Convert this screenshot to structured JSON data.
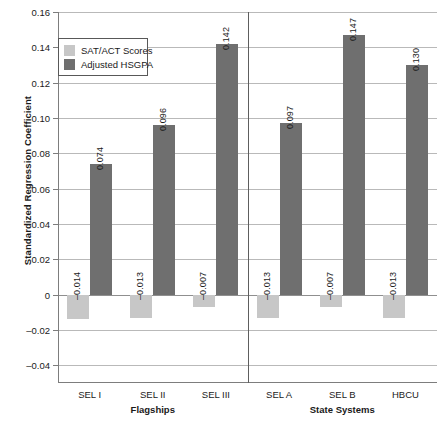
{
  "chart_data": {
    "type": "bar",
    "title": "",
    "xlabel": "",
    "ylabel": "Standardized Regression Coefficient",
    "ylim": [
      -0.05,
      0.16
    ],
    "yticks": [
      0.16,
      0.14,
      0.12,
      0.1,
      0.08,
      0.06,
      0.04,
      0.02,
      0,
      -0.02,
      -0.04
    ],
    "ytick_labels": [
      "0.16",
      "0.14",
      "0.12",
      "0.10",
      "0.08",
      "0.06",
      "0.04",
      "0.02",
      "0",
      "–0.02",
      "–0.04"
    ],
    "grid": true,
    "legend_position": "upper-left",
    "categories": [
      "SEL I",
      "SEL II",
      "SEL III",
      "SEL A",
      "SEL B",
      "HBCU"
    ],
    "groups": [
      {
        "label": "Flagships",
        "categories": [
          "SEL I",
          "SEL II",
          "SEL III"
        ]
      },
      {
        "label": "State Systems",
        "categories": [
          "SEL A",
          "SEL B",
          "HBCU"
        ]
      }
    ],
    "series": [
      {
        "name": "SAT/ACT Scores",
        "color": "#c7c7c7",
        "values": [
          -0.014,
          -0.013,
          -0.007,
          -0.013,
          -0.007,
          -0.013
        ],
        "labels": [
          "–0.014",
          "–0.013",
          "–0.007",
          "–0.013",
          "–0.007",
          "–0.013"
        ]
      },
      {
        "name": "Adjusted HSGPA",
        "color": "#6f6f6f",
        "values": [
          0.074,
          0.096,
          0.142,
          0.097,
          0.147,
          0.13
        ],
        "labels": [
          "0.074",
          "0.096",
          "0.142",
          "0.097",
          "0.147",
          "0.130"
        ]
      }
    ]
  },
  "legend": {
    "items": [
      {
        "label": "SAT/ACT Scores",
        "color": "#c7c7c7"
      },
      {
        "label": "Adjusted HSGPA",
        "color": "#6f6f6f"
      }
    ]
  },
  "axes": {
    "y_title": "Standardized Regression Coefficient"
  }
}
